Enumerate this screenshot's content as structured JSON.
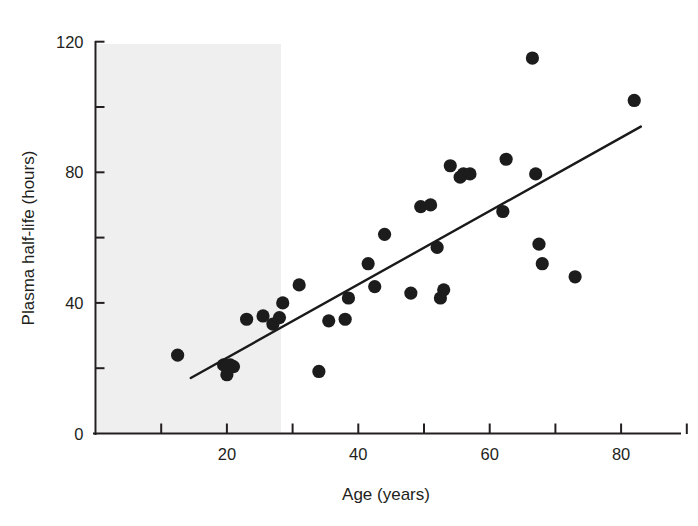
{
  "figure": {
    "kind": "scatter-plot-with-regression-line",
    "background_color": "#ffffff",
    "plot_area_shade_color": "#efefef",
    "point_color": "#1c1c1c",
    "line_color": "#1a1a1a",
    "axis_color": "#231f20"
  },
  "chart_data": {
    "type": "scatter",
    "title": "",
    "xlabel": "Age (years)",
    "ylabel": "Plasma half-life (hours)",
    "xlim": [
      0,
      90
    ],
    "ylim": [
      0,
      120
    ],
    "grid": false,
    "legend": null,
    "x_major_ticks": [
      20,
      40,
      60,
      80
    ],
    "x_minor_ticks": [
      10,
      30,
      50,
      70,
      90
    ],
    "x_tick_labels": [
      "20",
      "40",
      "60",
      "80"
    ],
    "y_major_ticks": [
      0,
      40,
      80,
      120
    ],
    "y_minor_ticks": [
      20,
      60,
      100
    ],
    "y_tick_labels": [
      "0",
      "40",
      "80",
      "120"
    ],
    "x": [
      12.5,
      19.5,
      20.0,
      20.5,
      21.0,
      23.0,
      25.5,
      27.0,
      28.0,
      28.5,
      31.0,
      34.0,
      35.5,
      38.0,
      38.5,
      41.5,
      42.5,
      44.0,
      48.0,
      49.5,
      51.0,
      52.0,
      52.5,
      53.0,
      54.0,
      55.5,
      56.0,
      57.0,
      62.0,
      62.5,
      66.5,
      67.0,
      67.5,
      68.0,
      73.0,
      82.0
    ],
    "y": [
      24.0,
      21.0,
      18.0,
      21.0,
      20.5,
      35.0,
      36.0,
      33.5,
      35.5,
      40.0,
      45.5,
      19.0,
      34.5,
      35.0,
      41.5,
      52.0,
      45.0,
      61.0,
      43.0,
      69.5,
      70.0,
      57.0,
      41.5,
      44.0,
      82.0,
      78.5,
      79.5,
      79.5,
      68.0,
      84.0,
      115.0,
      79.5,
      58.0,
      52.0,
      48.0,
      102.0
    ],
    "point_count": 36,
    "fit_line": {
      "label": "",
      "x_start": 14.5,
      "y_start": 17.0,
      "x_end": 83.0,
      "y_end": 94.0
    }
  }
}
